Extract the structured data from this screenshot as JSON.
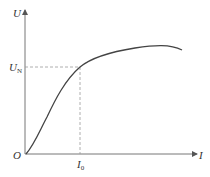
{
  "diagram": {
    "type": "characteristic-curve",
    "y_axis": {
      "label": "U"
    },
    "x_axis": {
      "label": "I"
    },
    "origin": {
      "label": "O"
    },
    "y_marker": {
      "label": "U",
      "subscript": "N"
    },
    "x_marker": {
      "label": "I",
      "subscript": "0"
    },
    "colors": {
      "axis": "#666666",
      "curve": "#444444",
      "dashed": "#888888",
      "text": "#333333"
    }
  }
}
